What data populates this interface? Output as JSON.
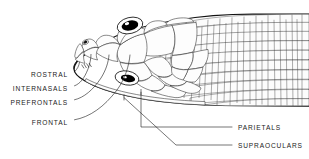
{
  "figure": {
    "background_color": "#ffffff",
    "ink_color": "#111111",
    "width": 309,
    "height": 159
  },
  "labels_left": [
    {
      "id": "rostral",
      "text": "ROSTRAL",
      "x": 72,
      "y": 74
    },
    {
      "id": "internasals",
      "text": "INTERNASALS",
      "x": 72,
      "y": 88
    },
    {
      "id": "prefrontals",
      "text": "PREFRONTALS",
      "x": 72,
      "y": 102
    },
    {
      "id": "frontal",
      "text": "FRONTAL",
      "x": 72,
      "y": 122
    }
  ],
  "labels_right": [
    {
      "id": "parietals",
      "text": "PARIETALS",
      "x": 243,
      "y": 129
    },
    {
      "id": "supraoculars",
      "text": "SUPRAOCULARS",
      "x": 243,
      "y": 147
    }
  ],
  "anatomy_parts": [
    "rostral",
    "internasals",
    "prefrontals",
    "frontal",
    "parietals",
    "supraoculars"
  ],
  "features": {
    "eye_upper": "dorsal-eye",
    "eye_lower": "lateral-eye",
    "nostril": "nostril",
    "neck_scales": "small-imbricate-body-scales",
    "head_scales": "large-plate-head-shields"
  }
}
